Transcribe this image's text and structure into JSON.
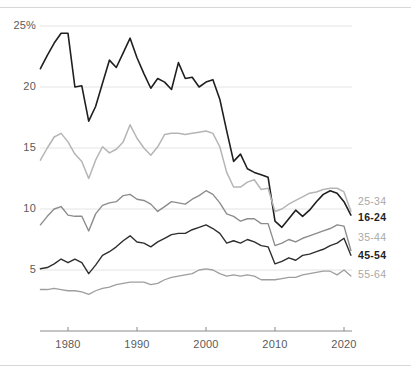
{
  "chart_data": {
    "type": "line",
    "title": "",
    "subtitle": "",
    "xlabel": "",
    "ylabel": "",
    "xlim": [
      1976,
      2021
    ],
    "ylim": [
      2.5,
      25.5
    ],
    "grid": "horizontal",
    "legend_position": "right",
    "y_ticks": [
      {
        "value": 25,
        "label": "25%"
      },
      {
        "value": 20,
        "label": "20"
      },
      {
        "value": 15,
        "label": "15"
      },
      {
        "value": 10,
        "label": "10"
      },
      {
        "value": 5,
        "label": "5"
      }
    ],
    "x_ticks": [
      {
        "value": 1980,
        "label": "1980"
      },
      {
        "value": 1990,
        "label": "1990"
      },
      {
        "value": 2000,
        "label": "2000"
      },
      {
        "value": 2010,
        "label": "2010"
      },
      {
        "value": 2020,
        "label": "2020"
      }
    ],
    "x": [
      1976,
      1977,
      1978,
      1979,
      1980,
      1981,
      1982,
      1983,
      1984,
      1985,
      1986,
      1987,
      1988,
      1989,
      1990,
      1991,
      1992,
      1993,
      1994,
      1995,
      1996,
      1997,
      1998,
      1999,
      2000,
      2001,
      2002,
      2003,
      2004,
      2005,
      2006,
      2007,
      2008,
      2009,
      2010,
      2011,
      2012,
      2013,
      2014,
      2015,
      2016,
      2017,
      2018,
      2019,
      2020,
      2021
    ],
    "series": [
      {
        "name": "16-24",
        "color": "#1f1f1f",
        "width": 1.6,
        "emphasis": true,
        "values": [
          21.5,
          22.6,
          23.6,
          24.4,
          24.4,
          20.0,
          20.1,
          17.2,
          18.4,
          20.3,
          22.2,
          21.6,
          22.8,
          24.0,
          22.4,
          21.1,
          19.9,
          20.7,
          20.4,
          19.8,
          22.0,
          20.7,
          20.8,
          20.0,
          20.4,
          20.6,
          19.0,
          16.4,
          13.9,
          14.5,
          13.3,
          13.0,
          12.8,
          12.6,
          9.0,
          8.5,
          9.2,
          9.9,
          9.4,
          9.9,
          10.6,
          11.2,
          11.5,
          11.3,
          10.6,
          9.5
        ]
      },
      {
        "name": "25-34",
        "color": "#b5b5b5",
        "width": 1.5,
        "emphasis": false,
        "values": [
          14.0,
          15.0,
          15.9,
          16.2,
          15.5,
          14.5,
          13.9,
          12.5,
          14.0,
          15.1,
          14.6,
          14.9,
          15.5,
          16.9,
          15.8,
          15.0,
          14.4,
          15.1,
          16.1,
          16.2,
          16.2,
          16.1,
          16.2,
          16.3,
          16.4,
          16.2,
          15.1,
          13.0,
          11.8,
          11.8,
          12.2,
          12.4,
          11.6,
          11.7,
          9.8,
          10.0,
          10.4,
          10.7,
          11.0,
          11.3,
          11.4,
          11.6,
          11.7,
          11.7,
          11.4,
          9.8
        ]
      },
      {
        "name": "35-44",
        "color": "#8c8c8c",
        "width": 1.4,
        "emphasis": false,
        "values": [
          8.7,
          9.4,
          10.0,
          10.2,
          9.5,
          9.4,
          9.4,
          8.2,
          9.6,
          10.3,
          10.5,
          10.6,
          11.1,
          11.2,
          10.8,
          10.7,
          10.4,
          9.8,
          10.2,
          10.6,
          10.5,
          10.4,
          10.8,
          11.1,
          11.5,
          11.2,
          10.5,
          9.6,
          9.4,
          9.0,
          9.2,
          9.2,
          8.8,
          8.8,
          7.0,
          7.2,
          7.5,
          7.3,
          7.6,
          7.8,
          8.0,
          8.2,
          8.4,
          8.7,
          8.6,
          6.6
        ]
      },
      {
        "name": "45-54",
        "color": "#2e2e2e",
        "width": 1.4,
        "emphasis": true,
        "values": [
          5.1,
          5.2,
          5.5,
          5.9,
          5.6,
          5.9,
          5.6,
          4.7,
          5.4,
          6.2,
          6.5,
          6.9,
          7.4,
          7.8,
          7.3,
          7.2,
          6.9,
          7.3,
          7.6,
          7.9,
          8.0,
          8.0,
          8.3,
          8.5,
          8.7,
          8.4,
          8.0,
          7.2,
          7.4,
          7.2,
          7.5,
          7.3,
          7.0,
          6.9,
          5.5,
          5.7,
          6.0,
          5.8,
          6.2,
          6.3,
          6.5,
          6.7,
          7.0,
          7.2,
          7.6,
          6.2
        ]
      },
      {
        "name": "55-64",
        "color": "#9e9e9e",
        "width": 1.3,
        "emphasis": false,
        "values": [
          3.4,
          3.4,
          3.5,
          3.4,
          3.3,
          3.3,
          3.2,
          3.0,
          3.3,
          3.5,
          3.6,
          3.8,
          3.9,
          4.0,
          4.0,
          4.0,
          3.8,
          3.9,
          4.2,
          4.4,
          4.5,
          4.6,
          4.7,
          5.0,
          5.1,
          5.0,
          4.7,
          4.5,
          4.6,
          4.5,
          4.6,
          4.5,
          4.2,
          4.2,
          4.2,
          4.3,
          4.4,
          4.4,
          4.6,
          4.7,
          4.8,
          4.9,
          4.9,
          4.6,
          5.0,
          4.5
        ]
      }
    ],
    "legend": [
      {
        "label": "25-34",
        "style": "light"
      },
      {
        "label": "16-24",
        "style": "bold"
      },
      {
        "label": "35-44",
        "style": "light"
      },
      {
        "label": "45-54",
        "style": "bold"
      },
      {
        "label": "55-64",
        "style": "light"
      }
    ],
    "colors": {
      "grid": "#e4e4e4",
      "axis": "#8a8a8a",
      "rule": "#d8d8d8",
      "tick_text": "#5a5a5a"
    }
  }
}
